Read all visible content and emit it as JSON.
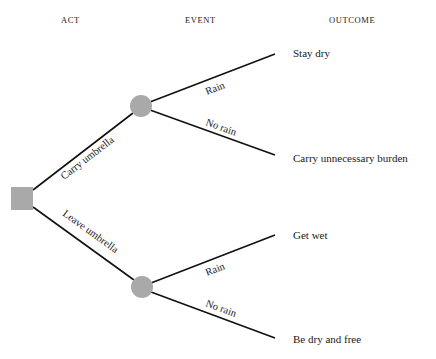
{
  "headers": {
    "act": "ACT",
    "event": "EVENT",
    "outcome": "OUTCOME"
  },
  "nodes": {
    "decision": {
      "type": "decision-square",
      "color": "#a9a9a9"
    },
    "chance_carry": {
      "type": "chance-circle",
      "color": "#a9a9a9"
    },
    "chance_leave": {
      "type": "chance-circle",
      "color": "#a9a9a9"
    }
  },
  "acts": [
    {
      "label": "Carry umbrella"
    },
    {
      "label": "Leave umbrella"
    }
  ],
  "events": {
    "carry": [
      {
        "label": "Rain"
      },
      {
        "label": "No rain"
      }
    ],
    "leave": [
      {
        "label": "Rain"
      },
      {
        "label": "No rain"
      }
    ]
  },
  "outcomes": [
    {
      "label": "Stay dry"
    },
    {
      "label": "Carry unnecessary burden"
    },
    {
      "label": "Get wet"
    },
    {
      "label": "Be dry and free"
    }
  ]
}
